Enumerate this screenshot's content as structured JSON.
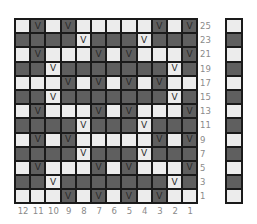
{
  "chart": {
    "columns": [
      "12",
      "11",
      "10",
      "9",
      "8",
      "7",
      "6",
      "5",
      "4",
      "3",
      "2",
      "1"
    ],
    "row_labels": [
      "25",
      "23",
      "21",
      "19",
      "17",
      "15",
      "13",
      "11",
      "9",
      "7",
      "5",
      "3",
      "1"
    ],
    "symbol": "V",
    "colors": {
      "light": "#ececec",
      "dark": "#5f5f5f",
      "border": "#1a1a1a",
      "label": "#8a8a8a"
    },
    "rows": [
      [
        "L",
        "DV",
        "L",
        "DV",
        "L",
        "L",
        "L",
        "L",
        "L",
        "DV",
        "L",
        "DV"
      ],
      [
        "D",
        "D",
        "D",
        "D",
        "LV",
        "D",
        "D",
        "D",
        "LV",
        "D",
        "D",
        "D"
      ],
      [
        "L",
        "DV",
        "L",
        "L",
        "L",
        "DV",
        "L",
        "DV",
        "L",
        "L",
        "L",
        "DV"
      ],
      [
        "D",
        "D",
        "LV",
        "D",
        "D",
        "D",
        "D",
        "D",
        "D",
        "D",
        "LV",
        "D"
      ],
      [
        "L",
        "L",
        "L",
        "DV",
        "L",
        "DV",
        "L",
        "DV",
        "L",
        "DV",
        "L",
        "L"
      ],
      [
        "D",
        "D",
        "LV",
        "D",
        "D",
        "D",
        "D",
        "D",
        "D",
        "D",
        "LV",
        "D"
      ],
      [
        "L",
        "DV",
        "L",
        "L",
        "L",
        "DV",
        "L",
        "DV",
        "L",
        "L",
        "L",
        "DV"
      ],
      [
        "D",
        "D",
        "D",
        "D",
        "LV",
        "D",
        "D",
        "D",
        "LV",
        "D",
        "D",
        "D"
      ],
      [
        "L",
        "DV",
        "L",
        "DV",
        "L",
        "L",
        "L",
        "L",
        "L",
        "DV",
        "L",
        "DV"
      ],
      [
        "D",
        "D",
        "D",
        "D",
        "LV",
        "D",
        "D",
        "D",
        "LV",
        "D",
        "D",
        "D"
      ],
      [
        "L",
        "DV",
        "L",
        "L",
        "L",
        "DV",
        "L",
        "DV",
        "L",
        "L",
        "L",
        "DV"
      ],
      [
        "D",
        "D",
        "LV",
        "D",
        "D",
        "D",
        "D",
        "D",
        "D",
        "D",
        "LV",
        "D"
      ],
      [
        "L",
        "L",
        "L",
        "DV",
        "L",
        "DV",
        "L",
        "DV",
        "L",
        "DV",
        "L",
        "L"
      ]
    ],
    "legend_column": [
      "L",
      "D",
      "L",
      "D",
      "L",
      "D",
      "L",
      "D",
      "L",
      "D",
      "L",
      "D",
      "L"
    ]
  }
}
